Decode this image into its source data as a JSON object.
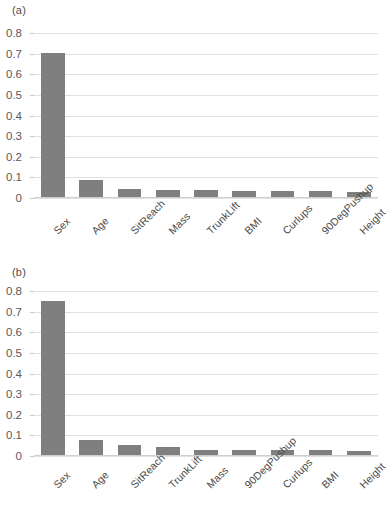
{
  "figure": {
    "background": "#ffffff",
    "bar_color": "#7f7f7f",
    "gridline_color": "#e0e0e0",
    "text_color": "#595959"
  },
  "panels": [
    {
      "label": "(a)",
      "chart_data": {
        "type": "bar",
        "title": "",
        "xlabel": "",
        "ylabel": "",
        "ylim": [
          0,
          0.8
        ],
        "yticks": [
          0,
          0.1,
          0.2,
          0.3,
          0.4,
          0.5,
          0.6,
          0.7,
          0.8
        ],
        "ytick_labels": [
          "0",
          "0.1",
          "0.2",
          "0.3",
          "0.4",
          "0.5",
          "0.6",
          "0.7",
          "0.8"
        ],
        "grid": true,
        "legend": "none",
        "categories": [
          "Sex",
          "Age",
          "SitReach",
          "Mass",
          "TrunkLift",
          "BMI",
          "Curlups",
          "90DegPushup",
          "Height"
        ],
        "values": [
          0.697,
          0.082,
          0.039,
          0.034,
          0.035,
          0.031,
          0.03,
          0.028,
          0.025
        ]
      }
    },
    {
      "label": "(b)",
      "chart_data": {
        "type": "bar",
        "title": "",
        "xlabel": "",
        "ylabel": "",
        "ylim": [
          0,
          0.8
        ],
        "yticks": [
          0,
          0.1,
          0.2,
          0.3,
          0.4,
          0.5,
          0.6,
          0.7,
          0.8
        ],
        "ytick_labels": [
          "0",
          "0.1",
          "0.2",
          "0.3",
          "0.4",
          "0.5",
          "0.6",
          "0.7",
          "0.8"
        ],
        "grid": true,
        "legend": "none",
        "categories": [
          "Sex",
          "Age",
          "SitReach",
          "TrunkLift",
          "Mass",
          "90DegPushup",
          "Curlups",
          "BMI",
          "Height"
        ],
        "values": [
          0.745,
          0.072,
          0.048,
          0.037,
          0.024,
          0.026,
          0.024,
          0.022,
          0.019
        ]
      }
    }
  ]
}
